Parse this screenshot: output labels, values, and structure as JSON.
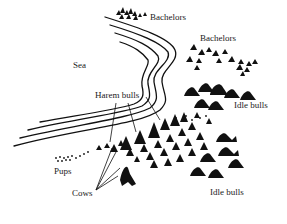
{
  "diagram": {
    "type": "illustration",
    "colors": {
      "ink": "#111111",
      "background": "#ffffff"
    },
    "labels": {
      "sea": "Sea",
      "bachelors_top": "Bachelors",
      "bachelors_right": "Bachelors",
      "harem_bulls": "Harem bulls",
      "idle_bulls_right": "Idle bulls",
      "pups": "Pups",
      "cows": "Cows",
      "idle_bulls_bottom": "Idle bulls"
    }
  }
}
